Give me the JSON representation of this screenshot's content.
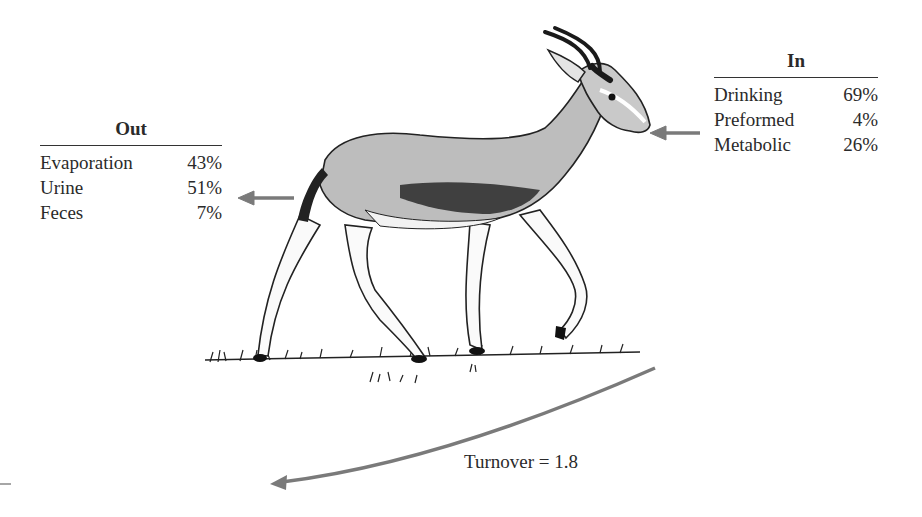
{
  "out_table": {
    "title": "Out",
    "rows": [
      {
        "label": "Evaporation",
        "value": "43%"
      },
      {
        "label": "Urine",
        "value": "51%"
      },
      {
        "label": "Feces",
        "value": "7%"
      }
    ]
  },
  "in_table": {
    "title": "In",
    "rows": [
      {
        "label": "Drinking",
        "value": "69%"
      },
      {
        "label": "Preformed",
        "value": "4%"
      },
      {
        "label": "Metabolic",
        "value": "26%"
      }
    ]
  },
  "turnover": {
    "label": "Turnover = 1.8"
  },
  "illustration": {
    "subject": "gazelle-walking-on-grass",
    "arrow_color": "#7a7a7a",
    "body_shade_color": "#b8b8b8"
  }
}
